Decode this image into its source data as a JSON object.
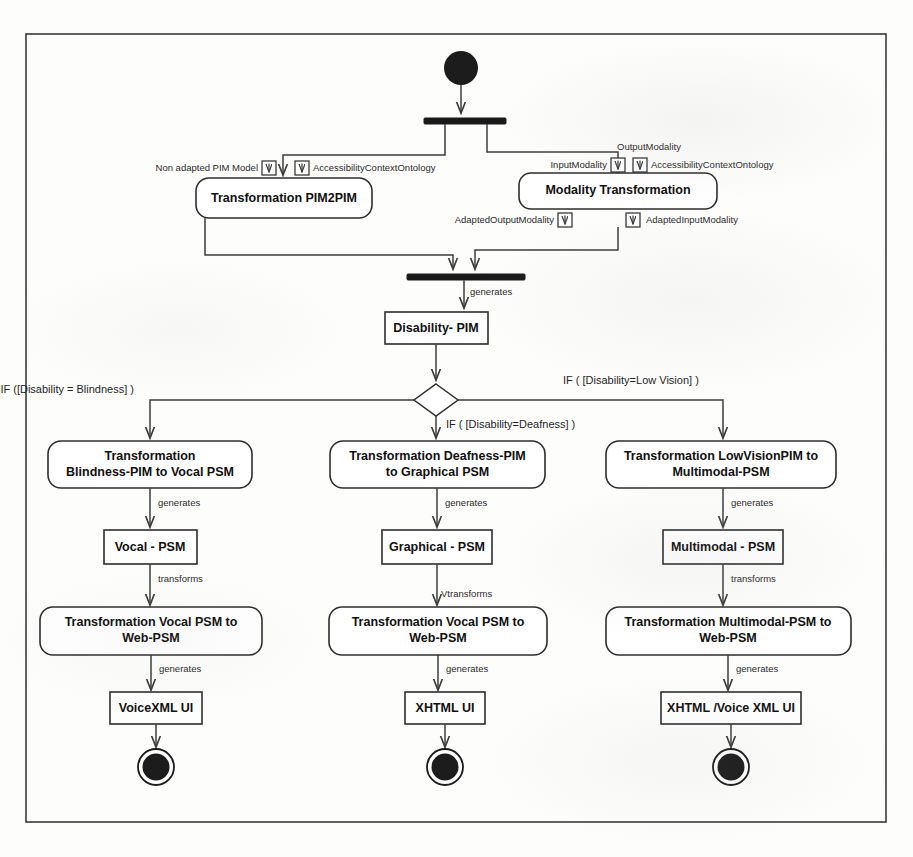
{
  "diagram": {
    "frame": {
      "x": 26,
      "y": 34,
      "width": 860,
      "height": 788
    },
    "colors": {
      "stroke": "#2e2e2e",
      "fill": "#ffffff",
      "bar": "#1a1a1a",
      "text": "#111111",
      "frame": "#3a3a3a"
    }
  },
  "nodes": {
    "initial": {
      "name": "initial-node",
      "label": ""
    },
    "fork_top": {
      "name": "fork-bar-top",
      "label": ""
    },
    "join_mid": {
      "name": "join-bar-middle",
      "label": ""
    },
    "decision": {
      "name": "decision-diamond",
      "label": ""
    },
    "pim2pim": {
      "label": "Transformation PIM2PIM"
    },
    "modality": {
      "label": "Modality Transformation"
    },
    "disability_pim": {
      "label": "Disability- PIM"
    },
    "blindness_transform": {
      "line1": "Transformation",
      "line2": "Blindness-PIM  to Vocal PSM"
    },
    "deafness_transform": {
      "line1": "Transformation Deafness-PIM",
      "line2": "to Graphical PSM"
    },
    "lowvision_transform": {
      "line1": "Transformation LowVisionPIM to",
      "line2": "Multimodal-PSM"
    },
    "vocal_psm": {
      "label": "Vocal - PSM"
    },
    "graphical_psm": {
      "label": "Graphical - PSM"
    },
    "multimodal_psm": {
      "label": "Multimodal - PSM"
    },
    "vocal_web_transform": {
      "line1": "Transformation Vocal PSM to",
      "line2": "Web-PSM"
    },
    "graphical_web_transform": {
      "line1": "Transformation Vocal PSM to",
      "line2": "Web-PSM"
    },
    "multimodal_web_transform": {
      "line1": "Transformation Multimodal-PSM to",
      "line2": "Web-PSM"
    },
    "voicexml_ui": {
      "label": "VoiceXML UI"
    },
    "xhtml_ui": {
      "label": "XHTML UI"
    },
    "xhtml_voice_ui": {
      "label": "XHTML /Voice XML UI"
    },
    "final_left": {
      "name": "final-node-left",
      "label": ""
    },
    "final_mid": {
      "name": "final-node-middle",
      "label": ""
    },
    "final_right": {
      "name": "final-node-right",
      "label": ""
    }
  },
  "pins": {
    "non_adapted_pim": "Non adapted PIM Model",
    "accessibility_ontology_left": "AccessibilityContextOntology",
    "input_modality": "InputModality",
    "output_modality": "OutputModality",
    "accessibility_ontology_right": "AccessibilityContextOntology",
    "adapted_output_modality": "AdaptedOutputModality",
    "adapted_input_modality": "AdaptedInputModality"
  },
  "edge_labels": {
    "generates_disability_pim": "generates",
    "guard_blindness": "IF  ([Disability = Blindness]   )",
    "guard_deafness": "IF ( [Disability=Deafness] )",
    "guard_lowvision": "IF ( [Disability=Low Vision]  )",
    "generates_vocal": "generates",
    "generates_graphical": "generates",
    "generates_multimodal": "generates",
    "transforms_vocal": "transforms",
    "transforms_graphical": "Vtransforms",
    "transforms_multimodal": "transforms",
    "generates_voicexml": "generates",
    "generates_xhtml": "generates",
    "generates_xhtml_voice": "generates"
  }
}
